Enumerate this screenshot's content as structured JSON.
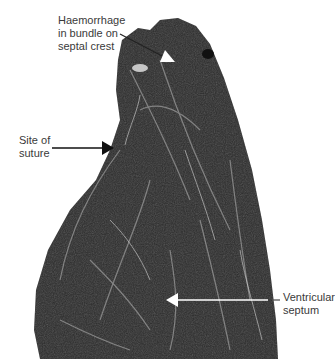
{
  "figure": {
    "annotations": [
      {
        "id": "haemorrhage",
        "text": "Haemorrhage\nin bundle on\nseptal crest",
        "arrow_color": "#ffffff",
        "leader_color": "#222222"
      },
      {
        "id": "suture",
        "text": "Site of\nsuture",
        "arrow_color": "#111111"
      },
      {
        "id": "septum",
        "text": "Ventricular\nseptum",
        "arrow_color": "#ffffff",
        "leader_color": "#555555"
      }
    ]
  }
}
